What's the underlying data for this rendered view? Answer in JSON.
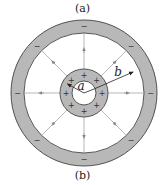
{
  "captions": {
    "top": "(a)",
    "bottom": "(b)"
  },
  "diagram": {
    "labels": {
      "inner_radius": "a",
      "outer_radius": "b"
    },
    "inner_shell": {
      "charge_symbol": "+",
      "charge_count": 8,
      "fill": "#b5b5b5"
    },
    "outer_shell": {
      "charge_symbol": "−",
      "charge_count": 8,
      "fill": "#b5b5b5"
    },
    "field_lines": {
      "count": 8,
      "direction": "outward",
      "color": "#999999"
    },
    "stroke_color": "#444444"
  }
}
